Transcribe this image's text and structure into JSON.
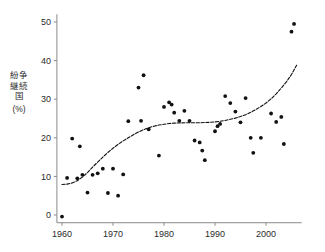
{
  "chart_data": {
    "type": "scatter",
    "title": "",
    "subtitle": "",
    "xlabel": "",
    "ylabel": "紛争継続国 (%)",
    "ylabel_chars": [
      "紛",
      "争",
      "継",
      "続",
      "国"
    ],
    "ylabel_unit": "(%)",
    "xlim": [
      1959,
      2007
    ],
    "ylim": [
      -2,
      52
    ],
    "xticks": [
      1960,
      1970,
      1980,
      1990,
      2000
    ],
    "yticks": [
      0,
      10,
      20,
      30,
      40,
      50
    ],
    "xtick_labels": [
      "1960",
      "1970",
      "1980",
      "1990",
      "2000"
    ],
    "ytick_labels": [
      "0",
      "10",
      "20",
      "30",
      "40",
      "50"
    ],
    "grid": false,
    "legend": null,
    "legend_position": "none",
    "point_color": "#111111",
    "curve_color": "#111111",
    "axis_color": "#8a8a8a",
    "series": [
      {
        "name": "observations",
        "marker": "circle",
        "points": [
          [
            1960,
            -0.4
          ],
          [
            1961,
            9.6
          ],
          [
            1962,
            19.8
          ],
          [
            1963,
            9.5
          ],
          [
            1963.5,
            17.8
          ],
          [
            1964,
            10.4
          ],
          [
            1965,
            5.8
          ],
          [
            1966,
            10.4
          ],
          [
            1967,
            10.8
          ],
          [
            1968,
            12.0
          ],
          [
            1969,
            5.7
          ],
          [
            1970,
            12.0
          ],
          [
            1971,
            5.0
          ],
          [
            1972,
            10.5
          ],
          [
            1973,
            24.3
          ],
          [
            1975,
            33.0
          ],
          [
            1975.5,
            24.4
          ],
          [
            1976,
            36.2
          ],
          [
            1977,
            22.2
          ],
          [
            1979,
            15.4
          ],
          [
            1980,
            28.0
          ],
          [
            1981,
            29.2
          ],
          [
            1981.5,
            28.6
          ],
          [
            1982,
            26.5
          ],
          [
            1983,
            24.4
          ],
          [
            1984,
            27.0
          ],
          [
            1985,
            24.4
          ],
          [
            1986,
            19.3
          ],
          [
            1987,
            18.8
          ],
          [
            1987.5,
            16.7
          ],
          [
            1988,
            14.2
          ],
          [
            1990,
            21.7
          ],
          [
            1990.5,
            23.0
          ],
          [
            1991,
            23.6
          ],
          [
            1992,
            30.8
          ],
          [
            1993,
            29.0
          ],
          [
            1994,
            26.8
          ],
          [
            1995,
            24.0
          ],
          [
            1996,
            30.3
          ],
          [
            1997,
            20.0
          ],
          [
            1997.5,
            16.1
          ],
          [
            1999,
            20.0
          ],
          [
            2001,
            26.3
          ],
          [
            2002,
            24.1
          ],
          [
            2003,
            25.4
          ],
          [
            2003.5,
            18.4
          ],
          [
            2005,
            47.5
          ],
          [
            2005.5,
            49.5
          ]
        ]
      }
    ],
    "trend": {
      "name": "smoothed-trend",
      "style": "dashed",
      "points": [
        [
          1960,
          7.9
        ],
        [
          1961,
          8.0
        ],
        [
          1962,
          8.3
        ],
        [
          1963,
          8.9
        ],
        [
          1964,
          9.8
        ],
        [
          1965,
          11.0
        ],
        [
          1966,
          12.4
        ],
        [
          1967,
          13.7
        ],
        [
          1968,
          15.0
        ],
        [
          1969,
          16.2
        ],
        [
          1970,
          17.3
        ],
        [
          1971,
          18.3
        ],
        [
          1972,
          19.2
        ],
        [
          1973,
          20.0
        ],
        [
          1974,
          20.8
        ],
        [
          1975,
          21.5
        ],
        [
          1976,
          22.1
        ],
        [
          1977,
          22.6
        ],
        [
          1978,
          23.0
        ],
        [
          1979,
          23.3
        ],
        [
          1980,
          23.5
        ],
        [
          1981,
          23.7
        ],
        [
          1982,
          23.8
        ],
        [
          1983,
          23.85
        ],
        [
          1984,
          23.9
        ],
        [
          1985,
          23.9
        ],
        [
          1986,
          23.9
        ],
        [
          1987,
          23.9
        ],
        [
          1988,
          23.95
        ],
        [
          1989,
          24.0
        ],
        [
          1990,
          24.1
        ],
        [
          1991,
          24.3
        ],
        [
          1992,
          24.5
        ],
        [
          1993,
          24.8
        ],
        [
          1994,
          25.1
        ],
        [
          1995,
          25.5
        ],
        [
          1996,
          26.0
        ],
        [
          1997,
          26.6
        ],
        [
          1998,
          27.3
        ],
        [
          1999,
          28.1
        ],
        [
          2000,
          29.0
        ],
        [
          2001,
          30.1
        ],
        [
          2002,
          31.4
        ],
        [
          2003,
          32.9
        ],
        [
          2004,
          34.5
        ],
        [
          2005,
          36.4
        ],
        [
          2006,
          38.8
        ]
      ]
    }
  }
}
